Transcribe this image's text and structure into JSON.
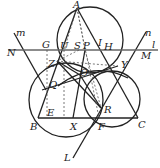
{
  "diagram": {
    "type": "geometry-construction",
    "points": {
      "A": [
        77,
        8
      ],
      "B": [
        38,
        120
      ],
      "C": [
        138,
        120
      ],
      "G": [
        47,
        50
      ],
      "N": [
        20,
        50
      ],
      "U": [
        64,
        50
      ],
      "S": [
        79,
        50
      ],
      "P": [
        85,
        50
      ],
      "I": [
        96,
        50
      ],
      "H": [
        104,
        50
      ],
      "M": [
        135,
        50
      ],
      "Z": [
        57,
        61
      ],
      "O": [
        80,
        75
      ],
      "Q": [
        50,
        82
      ],
      "Y": [
        118,
        66
      ],
      "E": [
        47,
        118
      ],
      "X": [
        73,
        118
      ],
      "F": [
        99,
        118
      ],
      "R": [
        101,
        108
      ],
      "L": [
        73,
        158
      ]
    },
    "labels": [
      {
        "text": "A",
        "x": 73,
        "y": 0
      },
      {
        "text": "m",
        "x": 16,
        "y": 28
      },
      {
        "text": "n",
        "x": 145,
        "y": 28
      },
      {
        "text": "G",
        "x": 42,
        "y": 40
      },
      {
        "text": "U",
        "x": 60,
        "y": 41
      },
      {
        "text": "S",
        "x": 74,
        "y": 41
      },
      {
        "text": "P",
        "x": 83,
        "y": 41
      },
      {
        "text": "I",
        "x": 98,
        "y": 38
      },
      {
        "text": "H",
        "x": 104,
        "y": 42
      },
      {
        "text": "l",
        "x": 152,
        "y": 40
      },
      {
        "text": "N",
        "x": 7,
        "y": 48
      },
      {
        "text": "M",
        "x": 141,
        "y": 51
      },
      {
        "text": "Z",
        "x": 48,
        "y": 59
      },
      {
        "text": "O",
        "x": 80,
        "y": 68
      },
      {
        "text": "Y",
        "x": 121,
        "y": 60
      },
      {
        "text": "Q",
        "x": 49,
        "y": 80
      },
      {
        "text": "B",
        "x": 30,
        "y": 122
      },
      {
        "text": "E",
        "x": 47,
        "y": 108
      },
      {
        "text": "X",
        "x": 70,
        "y": 122
      },
      {
        "text": "R",
        "x": 104,
        "y": 105
      },
      {
        "text": "F",
        "x": 98,
        "y": 122
      },
      {
        "text": "C",
        "x": 138,
        "y": 120
      },
      {
        "text": "L",
        "x": 64,
        "y": 153
      }
    ]
  }
}
